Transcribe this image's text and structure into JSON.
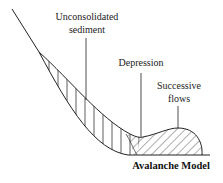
{
  "diagram": {
    "title": "Avalanche Model",
    "labels": {
      "sediment_line1": "Unconsolidated",
      "sediment_line2": "sediment",
      "depression": "Depression",
      "flows_line1": "Successive",
      "flows_line2": "flows"
    },
    "colors": {
      "stroke": "#222222",
      "background": "#ffffff"
    },
    "regions": [
      {
        "name": "unconsolidated-sediment",
        "hatch": "vertical"
      },
      {
        "name": "successive-flows",
        "hatch": "diagonal"
      }
    ]
  }
}
